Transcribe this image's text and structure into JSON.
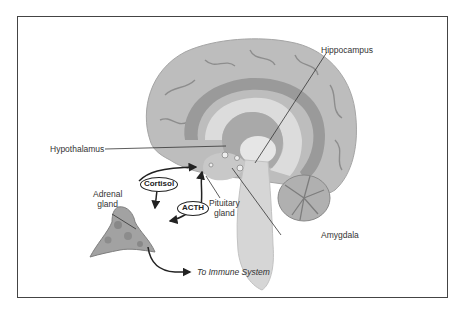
{
  "diagram": {
    "labels": {
      "hippocampus": "Hippocampus",
      "hypothalamus": "Hypothalamus",
      "pituitary_line1": "Pituitary",
      "pituitary_line2": "gland",
      "adrenal_line1": "Adrenal",
      "adrenal_line2": "gland",
      "amygdala": "Amygdala",
      "immune": "To Immune System"
    },
    "hormones": {
      "cortisol": "Cortisol",
      "acth": "ACTH"
    },
    "colors": {
      "border": "#444444",
      "brain_fill": "#bdbdbd",
      "brain_dark": "#9a9a9a",
      "brain_light": "#dcdcdc",
      "text": "#333333",
      "arrow": "#222222"
    }
  }
}
